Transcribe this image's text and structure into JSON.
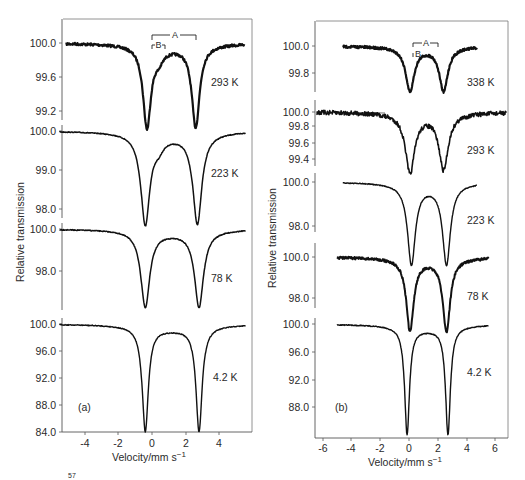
{
  "figure": {
    "ylabel": "Relative transmission",
    "xlabel": "Velocity/mm s",
    "xlabel_exponent": "−1",
    "footnote_fragment": "57"
  },
  "chart_data": [
    {
      "type": "line",
      "panel": "(a)",
      "title": "",
      "xlabel": "Velocity/mm s−1",
      "ylabel": "Relative transmission",
      "x_ticks": [
        -4,
        -2,
        0,
        2,
        4
      ],
      "xlim": [
        -5.5,
        5.8
      ],
      "grid": false,
      "legend": "none (temperature labels beside each trace)",
      "annotations": [
        "A (bracket over outer doublet, 293 K)",
        "B (bracket over inner doublet, 293 K)"
      ],
      "series": [
        {
          "name": "293 K",
          "y_ticks": [
            100.0,
            99.6,
            99.2
          ],
          "baseline": 100.0,
          "peaks": [
            {
              "x": -0.3,
              "y": 99.05
            },
            {
              "x": 2.6,
              "y": 99.05
            }
          ],
          "shoulder": {
            "x": 0.4,
            "y": 99.8
          },
          "noise": "high"
        },
        {
          "name": "223 K",
          "y_ticks": [
            100.0,
            99.0,
            98.0
          ],
          "baseline": 100.0,
          "peaks": [
            {
              "x": -0.4,
              "y": 97.7
            },
            {
              "x": 2.7,
              "y": 97.7
            }
          ],
          "shoulder": {
            "x": 0.4,
            "y": 99.6
          },
          "noise": "low"
        },
        {
          "name": "78 K",
          "y_ticks": [
            100.0,
            98.0
          ],
          "baseline": 100.0,
          "peaks": [
            {
              "x": -0.4,
              "y": 96.4
            },
            {
              "x": 2.8,
              "y": 96.4
            }
          ],
          "noise": "low"
        },
        {
          "name": "4.2 K",
          "y_ticks": [
            100.0,
            96.0,
            92.0,
            88.0,
            84.0
          ],
          "baseline": 100.0,
          "peaks": [
            {
              "x": -0.4,
              "y": 84.6
            },
            {
              "x": 2.8,
              "y": 84.6
            }
          ],
          "noise": "low"
        }
      ]
    },
    {
      "type": "line",
      "panel": "(b)",
      "title": "",
      "xlabel": "Velocity/mm s−1",
      "ylabel": "Relative transmission",
      "x_ticks": [
        -6,
        -4,
        -2,
        0,
        2,
        4,
        6
      ],
      "xlim": [
        -6.4,
        6.6
      ],
      "grid": false,
      "legend": "none (temperature labels beside each trace)",
      "annotations": [
        "A (bracket, 338 K)",
        "B (bracket, 338 K)"
      ],
      "series": [
        {
          "name": "338 K",
          "y_ticks": [
            100.0,
            99.8
          ],
          "baseline": 100.0,
          "peaks": [
            {
              "x": 0.0,
              "y": 99.68
            },
            {
              "x": 2.3,
              "y": 99.68
            }
          ],
          "noise": "high"
        },
        {
          "name": "293 K",
          "y_ticks": [
            100.0,
            99.8,
            99.6,
            99.4
          ],
          "baseline": 100.0,
          "peaks": [
            {
              "x": 0.0,
              "y": 99.25
            },
            {
              "x": 2.3,
              "y": 99.3
            }
          ],
          "noise": "very high"
        },
        {
          "name": "223 K",
          "y_ticks": [
            100.0,
            98.0
          ],
          "baseline": 100.0,
          "peaks": [
            {
              "x": 0.1,
              "y": 96.4
            },
            {
              "x": 2.5,
              "y": 96.4
            }
          ],
          "noise": "low"
        },
        {
          "name": "78 K",
          "y_ticks": [
            100.0,
            98.0
          ],
          "baseline": 100.0,
          "peaks": [
            {
              "x": 0.0,
              "y": 96.6
            },
            {
              "x": 2.5,
              "y": 96.6
            }
          ],
          "noise": "high"
        },
        {
          "name": "4.2 K",
          "y_ticks": [
            100.0,
            96.0,
            92.0,
            88.0
          ],
          "baseline": 100.0,
          "peaks": [
            {
              "x": -0.2,
              "y": 84.8
            },
            {
              "x": 2.6,
              "y": 84.8
            }
          ],
          "noise": "low"
        }
      ]
    }
  ],
  "panels": {
    "a": {
      "label": "(a)",
      "x_tick_labels": [
        "-4",
        "-2",
        "0",
        "2",
        "4"
      ],
      "temps": [
        "293 K",
        "223 K",
        "78 K",
        "4.2 K"
      ],
      "y_tick_labels": {
        "t293": [
          "100.0",
          "99.6",
          "99.2"
        ],
        "t223": [
          "100.0",
          "99.0",
          "98.0"
        ],
        "t78": [
          "100.0",
          "98.0"
        ],
        "t4": [
          "100.0",
          "96.0",
          "92.0",
          "88.0",
          "84.0"
        ]
      },
      "bracket_a": "A",
      "bracket_b": "B"
    },
    "b": {
      "label": "(b)",
      "x_tick_labels": [
        "-6",
        "-4",
        "-2",
        "0",
        "2",
        "4",
        "6"
      ],
      "temps": [
        "338 K",
        "293 K",
        "223 K",
        "78 K",
        "4.2 K"
      ],
      "y_tick_labels": {
        "t338": [
          "100.0",
          "99.8"
        ],
        "t293": [
          "100.0",
          "99.8",
          "99.6",
          "99.4"
        ],
        "t223": [
          "100.0",
          "98.0"
        ],
        "t78": [
          "100.0",
          "98.0"
        ],
        "t4": [
          "100.0",
          "96.0",
          "92.0",
          "88.0"
        ]
      },
      "bracket_a": "A",
      "bracket_b": "B"
    }
  },
  "colors": {
    "trace": "#111111",
    "axis": "#555555",
    "background": "#ffffff"
  }
}
